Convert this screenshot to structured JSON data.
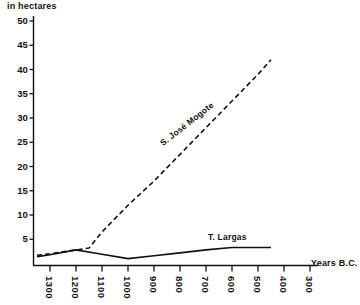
{
  "chart_data": {
    "type": "line",
    "title": "",
    "ylabel": "in hectares",
    "xlabel": "Years B.C.",
    "grid": false,
    "legend": "inline-annotations",
    "xlim": [
      1350,
      280
    ],
    "ylim": [
      0,
      52
    ],
    "x_tick_labels": [
      "1300",
      "1200",
      "1100",
      "1000",
      "900",
      "800",
      "700",
      "600",
      "500",
      "400",
      "300"
    ],
    "x_tick_values": [
      1300,
      1200,
      1100,
      1000,
      900,
      800,
      700,
      600,
      500,
      400,
      300
    ],
    "y_tick_labels": [
      "5",
      "10",
      "15",
      "20",
      "25",
      "30",
      "35",
      "40",
      "45",
      "50"
    ],
    "y_tick_values": [
      5,
      10,
      15,
      20,
      25,
      30,
      35,
      40,
      45,
      50
    ],
    "series": [
      {
        "name": "S. José Mogote",
        "style": "dashed",
        "color": "#111111",
        "x": [
          1350,
          1300,
          1200,
          1150,
          1100,
          1000,
          900,
          800,
          700,
          600,
          500,
          450
        ],
        "values": [
          1.7,
          2.0,
          2.8,
          3.2,
          6.5,
          12.0,
          17.0,
          22.5,
          28.0,
          33.5,
          39.0,
          42.0
        ]
      },
      {
        "name": "T. Largas",
        "style": "solid",
        "color": "#111111",
        "x": [
          1350,
          1300,
          1200,
          1100,
          1000,
          900,
          800,
          700,
          600,
          500,
          450
        ],
        "values": [
          1.4,
          1.8,
          2.8,
          1.9,
          1.0,
          1.6,
          2.2,
          2.8,
          3.3,
          3.3,
          3.3
        ]
      }
    ]
  },
  "annotations": {
    "mogote_label": "S. José Mogote",
    "largas_label": "T. Largas"
  }
}
